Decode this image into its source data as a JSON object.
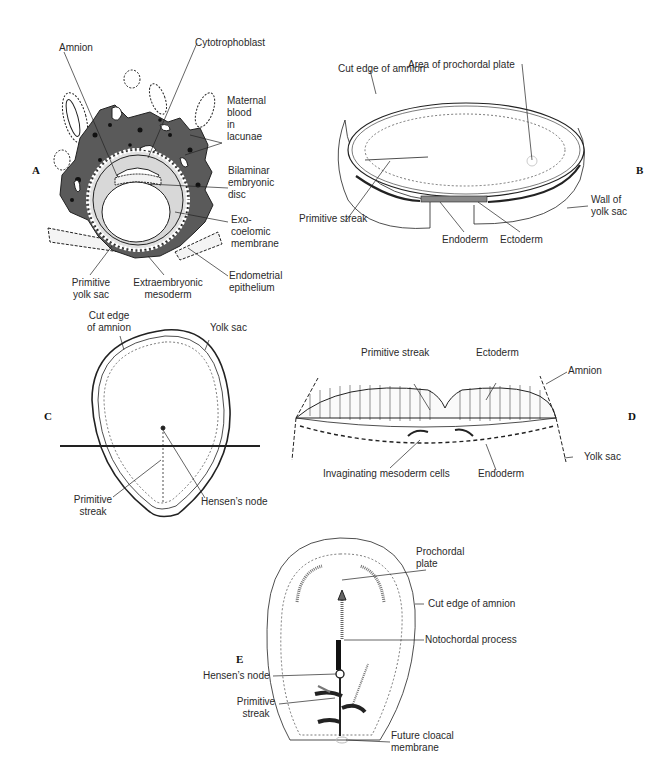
{
  "figure": {
    "panels": {
      "A": {
        "letter": "A",
        "labels": {
          "amnion": "Amnion",
          "cytotrophoblast": "Cytotrophoblast",
          "maternal_blood_1": "Maternal",
          "maternal_blood_2": "blood",
          "maternal_blood_3": "in",
          "maternal_blood_4": "lacunae",
          "bilaminar_1": "Bilaminar",
          "bilaminar_2": "embryonic",
          "bilaminar_3": "disc",
          "exo_1": "Exo-",
          "exo_2": "coelomic",
          "exo_3": "membrane",
          "endometrial_1": "Endometrial",
          "endometrial_2": "epithelium",
          "primitive_yolk_1": "Primitive",
          "primitive_yolk_2": "yolk sac",
          "extraemb_1": "Extraembryonic",
          "extraemb_2": "mesoderm"
        }
      },
      "B": {
        "letter": "B",
        "labels": {
          "cut_edge": "Cut edge of amnion",
          "prochordal": "Area of prochordal plate",
          "primitive_streak": "Primitive streak",
          "endoderm": "Endoderm",
          "ectoderm": "Ectoderm",
          "wall_1": "Wall of",
          "wall_2": "yolk sac"
        }
      },
      "C": {
        "letter": "C",
        "labels": {
          "cut_edge_1": "Cut edge",
          "cut_edge_2": "of amnion",
          "yolk_sac": "Yolk sac",
          "primitive_1": "Primitive",
          "primitive_2": "streak",
          "hensens": "Hensen’s node"
        }
      },
      "D": {
        "letter": "D",
        "labels": {
          "primitive_streak": "Primitive streak",
          "ectoderm": "Ectoderm",
          "amnion": "Amnion",
          "yolk_sac": "Yolk sac",
          "invaginating": "Invaginating mesoderm cells",
          "endoderm": "Endoderm"
        }
      },
      "E": {
        "letter": "E",
        "labels": {
          "prochordal_1": "Prochordal",
          "prochordal_2": "plate",
          "cut_edge": "Cut edge of amnion",
          "notochordal": "Notochordal process",
          "hensens": "Hensen’s node",
          "primitive_1": "Primitive",
          "primitive_2": "streak",
          "cloacal_1": "Future cloacal",
          "cloacal_2": "membrane"
        }
      }
    },
    "colors": {
      "ink": "#222222",
      "trophoblast": "#5a5a5a",
      "light_fill": "#d8d8d8",
      "background": "#ffffff"
    }
  }
}
